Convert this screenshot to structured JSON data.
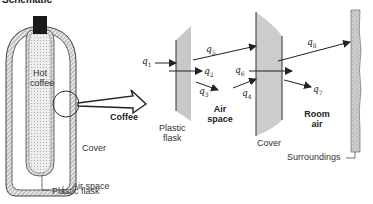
{
  "title": "Schematic",
  "flask_figure": {
    "inner_label_line1": "Hot",
    "inner_label_line2": "coffee",
    "cover_label": "Cover",
    "air_space_label": "Air space",
    "plastic_flask_label": "Plastic flask"
  },
  "detail_figure": {
    "coffee_label": "Coffee",
    "plastic_flask_label_line1": "Plastic",
    "plastic_flask_label_line2": "flask",
    "air_space_label_line1": "Air",
    "air_space_label_line2": "space",
    "cover_label": "Cover",
    "room_air_label_line1": "Room",
    "room_air_label_line2": "air",
    "surroundings_label": "Surroundings",
    "heat_flows": [
      {
        "symbol": "q",
        "index": "1"
      },
      {
        "symbol": "q",
        "index": "2"
      },
      {
        "symbol": "q",
        "index": "3"
      },
      {
        "symbol": "q",
        "index": "4"
      },
      {
        "symbol": "q",
        "index": "5"
      },
      {
        "symbol": "q",
        "index": "6"
      },
      {
        "symbol": "q",
        "index": "7"
      },
      {
        "symbol": "q",
        "index": "8"
      }
    ]
  },
  "colors": {
    "wall_gray": "#c8c8c8",
    "hatch": "#777777",
    "stopper": "#1a1a1a",
    "line": "#222222"
  }
}
